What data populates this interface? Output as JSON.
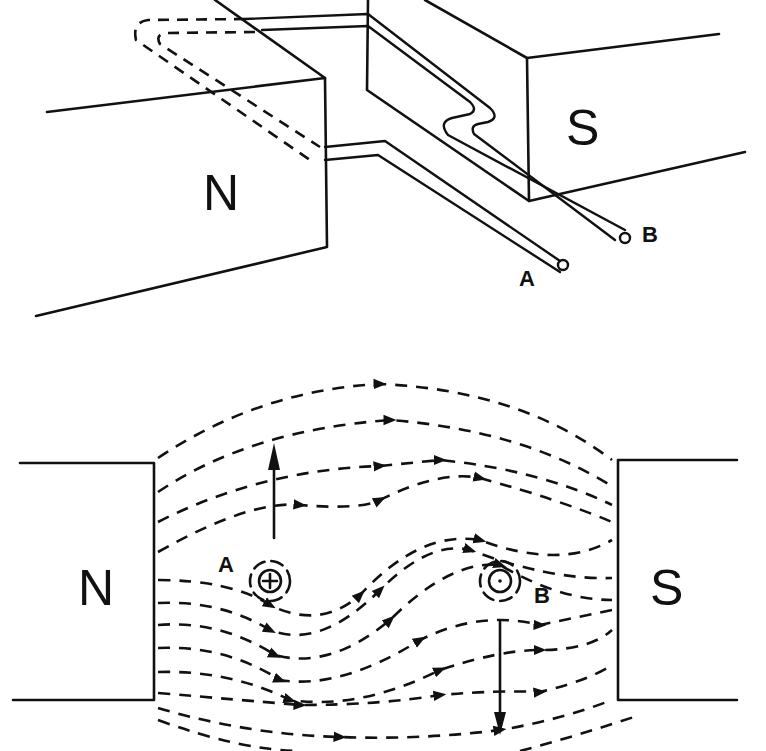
{
  "top_figure": {
    "magnet_left_label": "N",
    "magnet_right_label": "S",
    "wire_end_a_label": "A",
    "wire_end_b_label": "B"
  },
  "bottom_figure": {
    "magnet_left_label": "N",
    "magnet_right_label": "S",
    "conductor_a_label": "A",
    "conductor_a_symbol": "+",
    "conductor_b_label": "B",
    "conductor_b_symbol": "·",
    "force_a_direction": "up",
    "force_b_direction": "down"
  },
  "colors": {
    "ink": "#111111",
    "background": "#ffffff"
  }
}
